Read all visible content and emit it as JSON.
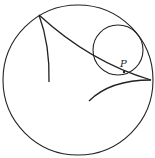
{
  "diagram": {
    "type": "hypocycloid",
    "stroke_color": "#222222",
    "background": "#ffffff",
    "outer_circle": {
      "cx": 78,
      "cy": 80,
      "r": 75
    },
    "rolling_circle": {
      "cx": 118,
      "cy": 50,
      "r": 25
    },
    "cusps": [
      {
        "x": 39,
        "y": 15
      },
      {
        "x": 151,
        "y": 80
      }
    ],
    "point": {
      "label": "P",
      "x": 124,
      "y": 72
    },
    "curves": [
      {
        "name": "arc-cusp1-to-cusp2",
        "d": "M39,15 Q90,62 151,80"
      },
      {
        "name": "arc-cusp1-down",
        "d": "M39,15 Q50,45 49,82"
      },
      {
        "name": "arc-cusp2-down",
        "d": "M151,80 Q110,80 89,101"
      }
    ]
  }
}
